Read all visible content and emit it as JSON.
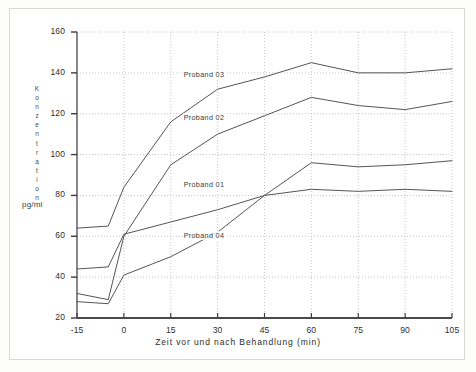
{
  "figure": {
    "unit_label": "pg/ml",
    "y_axis_title_letters": [
      "K",
      "o",
      "n",
      "z",
      "e",
      "n",
      "t",
      "r",
      "a",
      "t",
      "i",
      "o",
      "n"
    ],
    "x_axis_title": "Zeit vor und nach Behandlung (min)"
  },
  "chart_data": {
    "type": "line",
    "title": "",
    "xlabel": "Zeit vor und nach Behandlung (min)",
    "ylabel": "Konzentration",
    "yunit": "pg/ml",
    "xlim": [
      -15,
      105
    ],
    "ylim": [
      20,
      160
    ],
    "xticks": [
      -15,
      0,
      15,
      30,
      45,
      60,
      75,
      90,
      105
    ],
    "yticks": [
      20,
      40,
      60,
      80,
      100,
      120,
      140,
      160
    ],
    "xticklabels": [
      "-15",
      "0",
      "15",
      "30",
      "45",
      "60",
      "75",
      "90",
      "105"
    ],
    "yticklabels": [
      "20",
      "40",
      "60",
      "80",
      "100",
      "120",
      "140",
      "160"
    ],
    "grid": true,
    "grid_style": "dotted",
    "legend": "inline-annotations",
    "line_color": "#555555",
    "x": [
      -15,
      -5,
      0,
      15,
      30,
      45,
      60,
      75,
      90,
      105
    ],
    "series": [
      {
        "name": "Proband 03",
        "label": "Proband 03",
        "values": [
          64,
          65,
          84,
          116,
          132,
          138,
          145,
          140,
          140,
          142
        ],
        "label_x": 30,
        "label_y": 139
      },
      {
        "name": "Proband 02",
        "label": "Proband 02",
        "values": [
          32,
          29,
          60,
          95,
          110,
          119,
          128,
          124,
          122,
          126
        ],
        "label_x": 30,
        "label_y": 118
      },
      {
        "name": "Proband 01",
        "label": "Proband 01",
        "values": [
          44,
          45,
          61,
          67,
          73,
          80,
          83,
          82,
          83,
          82
        ],
        "label_x": 30,
        "label_y": 85
      },
      {
        "name": "Proband 04",
        "label": "Proband 04",
        "values": [
          28,
          27,
          41,
          50,
          62,
          80,
          96,
          94,
          95,
          97
        ],
        "label_x": 30,
        "label_y": 60
      }
    ]
  }
}
